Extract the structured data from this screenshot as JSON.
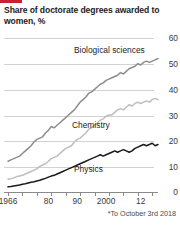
{
  "brand": {
    "accent_color": "#c9222e"
  },
  "chart_data": {
    "type": "line",
    "title": "Share of doctorate degrees awarded to women, %",
    "xlabel": "",
    "ylabel": "",
    "ylim": [
      0,
      60
    ],
    "xlim": [
      1966,
      2018
    ],
    "grid": true,
    "legend_position": "inline-labels",
    "footnote": "*To October 3rd 2018",
    "ytick_labels": [
      "0",
      "10",
      "20",
      "30",
      "40",
      "50",
      "60"
    ],
    "ytick_values": [
      0,
      10,
      20,
      30,
      40,
      50,
      60
    ],
    "xtick_labels": [
      "1966",
      "80",
      "90",
      "2000",
      "12"
    ],
    "xtick_values": [
      1966,
      1980,
      1990,
      2000,
      2012
    ],
    "x": [
      1966,
      1967,
      1968,
      1969,
      1970,
      1971,
      1972,
      1973,
      1974,
      1975,
      1976,
      1977,
      1978,
      1979,
      1980,
      1981,
      1982,
      1983,
      1984,
      1985,
      1986,
      1987,
      1988,
      1989,
      1990,
      1991,
      1992,
      1993,
      1994,
      1995,
      1996,
      1997,
      1998,
      1999,
      2000,
      2001,
      2002,
      2003,
      2004,
      2005,
      2006,
      2007,
      2008,
      2009,
      2010,
      2011,
      2012,
      2013,
      2014,
      2015,
      2016,
      2017,
      2018
    ],
    "series": [
      {
        "name": "Biological sciences",
        "color": "#8d8d8d",
        "values": [
          12,
          12.5,
          13,
          13.5,
          14,
          15,
          16,
          17,
          18,
          19.5,
          20.5,
          21,
          21.5,
          23,
          24,
          25.5,
          25,
          26,
          27,
          28,
          29,
          30,
          31,
          32,
          33.5,
          35,
          36,
          37,
          38.5,
          39,
          40,
          41,
          42,
          42.5,
          43.5,
          44,
          44.5,
          45,
          45.5,
          46.5,
          46,
          47,
          48,
          48.5,
          49,
          50,
          49.5,
          50.5,
          51,
          50.5,
          51,
          51.5,
          52
        ]
      },
      {
        "name": "Chemistry",
        "color": "#bdbdbd",
        "values": [
          5,
          5.2,
          5.5,
          6,
          6.2,
          6.5,
          7,
          7.5,
          8,
          8.5,
          9,
          10,
          10.5,
          11,
          12,
          13,
          13.5,
          14,
          15,
          16,
          17,
          17.5,
          18,
          19.5,
          20.5,
          21,
          22,
          23,
          24.5,
          25,
          26,
          27,
          28,
          28.5,
          29.5,
          30,
          30,
          31,
          32,
          32.5,
          32,
          33,
          34,
          33.5,
          34.5,
          35,
          34.5,
          35,
          35.5,
          35,
          36,
          36.5,
          36
        ]
      },
      {
        "name": "Physics",
        "color": "#1a1a1a",
        "values": [
          2,
          2.1,
          2.3,
          2.5,
          2.7,
          3,
          3.2,
          3.5,
          3.8,
          4,
          4.3,
          4.6,
          5,
          5.3,
          5.8,
          6.2,
          6.5,
          7,
          7.5,
          8,
          8.5,
          9,
          9.5,
          10,
          10.5,
          11,
          11.5,
          12,
          12.5,
          13,
          13.5,
          14,
          14.5,
          14,
          14.5,
          15,
          15.5,
          16,
          15.5,
          16,
          16.5,
          16,
          15.5,
          16,
          17,
          17.5,
          18,
          18.5,
          18,
          18.5,
          19,
          18,
          18.5
        ]
      }
    ],
    "series_labels": [
      {
        "name": "Biological sciences",
        "x_px": 74,
        "y_px": 50
      },
      {
        "name": "Chemistry",
        "x_px": 72,
        "y_px": 125
      },
      {
        "name": "Physics",
        "x_px": 74,
        "y_px": 169
      }
    ]
  }
}
